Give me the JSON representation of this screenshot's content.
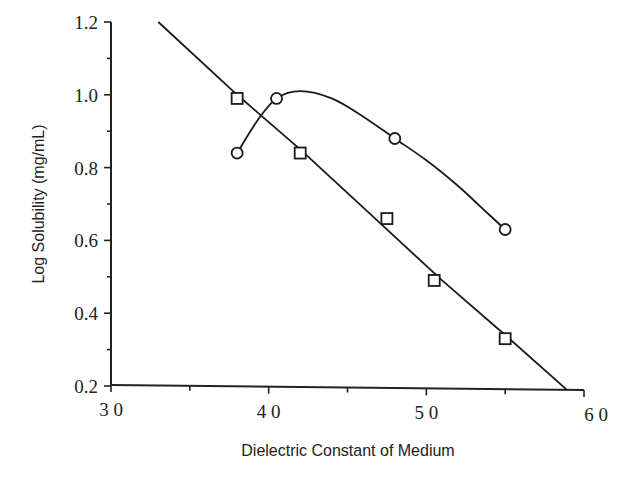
{
  "chart_data": {
    "type": "line",
    "title": "",
    "xlabel": "Dielectric Constant of Medium",
    "ylabel": "Log Solubility (mg/mL)",
    "xlim": [
      30,
      60
    ],
    "ylim": [
      0.2,
      1.2
    ],
    "x_ticks": [
      30,
      40,
      50,
      60
    ],
    "x_tick_labels": [
      "3 0",
      "4 0",
      "5 0",
      "6 0"
    ],
    "x_minor_ticks": [
      35,
      45,
      55
    ],
    "y_ticks": [
      0.2,
      0.4,
      0.6,
      0.8,
      1.0,
      1.2
    ],
    "y_tick_labels": [
      "0.2",
      "0.4",
      "0.6",
      "0.8",
      "1.0",
      "1.2"
    ],
    "y_minor_ticks": [
      0.3,
      0.5,
      0.7,
      0.9,
      1.1
    ],
    "grid": false,
    "legend": null,
    "series": [
      {
        "name": "squares",
        "marker": "square",
        "points": [
          {
            "x": 38.0,
            "y": 0.99
          },
          {
            "x": 42.0,
            "y": 0.84
          },
          {
            "x": 47.5,
            "y": 0.66
          },
          {
            "x": 50.5,
            "y": 0.49
          },
          {
            "x": 55.0,
            "y": 0.33
          }
        ],
        "fit_line": [
          {
            "x": 33.0,
            "y": 1.2
          },
          {
            "x": 38.0,
            "y": 1.0
          },
          {
            "x": 42.0,
            "y": 0.85
          },
          {
            "x": 47.0,
            "y": 0.65
          },
          {
            "x": 51.0,
            "y": 0.49
          },
          {
            "x": 55.0,
            "y": 0.34
          },
          {
            "x": 58.9,
            "y": 0.19
          }
        ]
      },
      {
        "name": "circles",
        "marker": "circle",
        "points": [
          {
            "x": 38.0,
            "y": 0.84
          },
          {
            "x": 40.5,
            "y": 0.99
          },
          {
            "x": 48.0,
            "y": 0.88
          },
          {
            "x": 55.0,
            "y": 0.63
          }
        ],
        "fit_curve": [
          {
            "x": 38.0,
            "y": 0.84
          },
          {
            "x": 39.3,
            "y": 0.93
          },
          {
            "x": 40.5,
            "y": 0.99
          },
          {
            "x": 42.0,
            "y": 1.01
          },
          {
            "x": 44.0,
            "y": 0.99
          },
          {
            "x": 46.0,
            "y": 0.94
          },
          {
            "x": 48.0,
            "y": 0.88
          },
          {
            "x": 50.0,
            "y": 0.82
          },
          {
            "x": 52.0,
            "y": 0.75
          },
          {
            "x": 53.5,
            "y": 0.69
          },
          {
            "x": 55.0,
            "y": 0.63
          }
        ]
      }
    ]
  }
}
